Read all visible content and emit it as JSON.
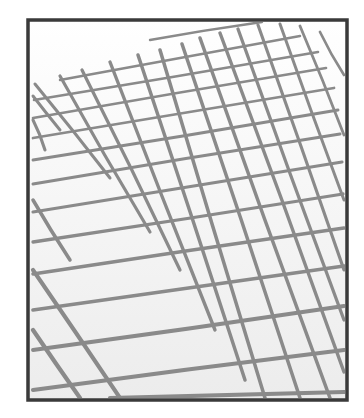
{
  "figure": {
    "frame": {
      "x": 28,
      "y": 20,
      "width": 319,
      "height": 380
    },
    "colors": {
      "frame": "#3a3a3a",
      "grid": "#8a8a8a",
      "paper_top": "#ffffff",
      "paper_bottom": "#ececec"
    },
    "rising_lines": [
      [
        150,
        40,
        262,
        22
      ],
      [
        60,
        80,
        300,
        36
      ],
      [
        34,
        100,
        318,
        52
      ],
      [
        33,
        118,
        326,
        68
      ],
      [
        33,
        138,
        334,
        88
      ],
      [
        33,
        160,
        338,
        110
      ],
      [
        33,
        184,
        340,
        134
      ],
      [
        33,
        212,
        342,
        162
      ],
      [
        33,
        242,
        343,
        194
      ],
      [
        33,
        274,
        344,
        228
      ],
      [
        33,
        310,
        344,
        266
      ],
      [
        33,
        350,
        344,
        306
      ],
      [
        33,
        390,
        344,
        350
      ],
      [
        110,
        398,
        344,
        392
      ]
    ],
    "descending_lines": [
      [
        33,
        96,
        60,
        130
      ],
      [
        35,
        84,
        110,
        178
      ],
      [
        60,
        76,
        150,
        232
      ],
      [
        82,
        70,
        180,
        270
      ],
      [
        110,
        62,
        215,
        330
      ],
      [
        138,
        55,
        245,
        380
      ],
      [
        160,
        50,
        265,
        398
      ],
      [
        182,
        44,
        300,
        398
      ],
      [
        200,
        38,
        330,
        398
      ],
      [
        220,
        33,
        344,
        372
      ],
      [
        238,
        29,
        344,
        320
      ],
      [
        258,
        25,
        344,
        270
      ],
      [
        280,
        24,
        344,
        200
      ],
      [
        300,
        26,
        344,
        135
      ],
      [
        320,
        32,
        344,
        75
      ],
      [
        33,
        120,
        45,
        150
      ],
      [
        33,
        200,
        70,
        260
      ],
      [
        33,
        270,
        120,
        398
      ],
      [
        33,
        330,
        80,
        398
      ]
    ]
  }
}
